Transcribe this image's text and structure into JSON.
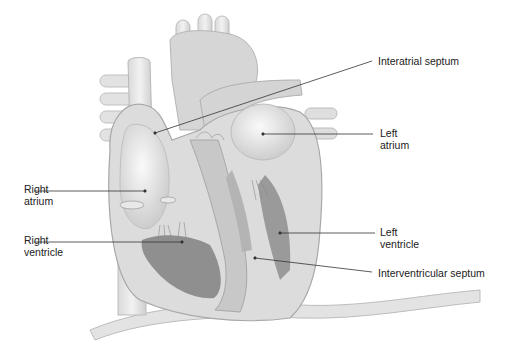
{
  "diagram": {
    "colors": {
      "background": "#ffffff",
      "tissue_light": "#e6e6e6",
      "tissue_mid": "#cfcfcf",
      "tissue_dark": "#9e9e9e",
      "muscle": "#8c8c8c",
      "leader_line": "#333333",
      "text": "#222222"
    },
    "labels": [
      {
        "id": "interatrial-septum",
        "lines": [
          "Interatrial septum"
        ],
        "side": "right"
      },
      {
        "id": "left-atrium",
        "lines": [
          "Left",
          "atrium"
        ],
        "side": "right"
      },
      {
        "id": "right-atrium",
        "lines": [
          "Right",
          "atrium"
        ],
        "side": "left"
      },
      {
        "id": "right-ventricle",
        "lines": [
          "Right",
          "ventricle"
        ],
        "side": "left"
      },
      {
        "id": "left-ventricle",
        "lines": [
          "Left",
          "ventricle"
        ],
        "side": "right"
      },
      {
        "id": "interventricular-septum",
        "lines": [
          "Interventricular septum"
        ],
        "side": "right"
      }
    ]
  }
}
